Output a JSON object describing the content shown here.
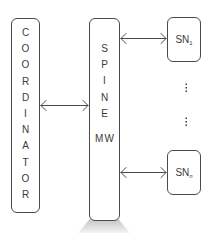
{
  "diagram": {
    "coordinator": {
      "label": "COORDINATOR",
      "letters": [
        "C",
        "O",
        "O",
        "R",
        "D",
        "I",
        "N",
        "A",
        "T",
        "O",
        "R"
      ]
    },
    "spine": {
      "label": "SPINE MW",
      "letters_top": [
        "S",
        "P",
        "I",
        "N",
        "E"
      ],
      "letters_bottom": [
        "M",
        "W"
      ]
    },
    "storage_nodes": [
      {
        "base": "SN",
        "subscript": "1"
      },
      {
        "base": "SN",
        "subscript": "n"
      }
    ],
    "ellipsis": [
      "⋮",
      "⋮"
    ],
    "connections": [
      {
        "from": "COORDINATOR",
        "to": "SPINE MW",
        "type": "bidirectional"
      },
      {
        "from": "SPINE MW",
        "to": "SN1",
        "type": "bidirectional"
      },
      {
        "from": "SPINE MW",
        "to": "SNn",
        "type": "bidirectional"
      }
    ],
    "colors": {
      "stroke": "#4a4a4a",
      "text": "#3a3a3a",
      "spotlight_top": "#8a8a8a",
      "spotlight_bottom": "#f2f2f2"
    }
  }
}
